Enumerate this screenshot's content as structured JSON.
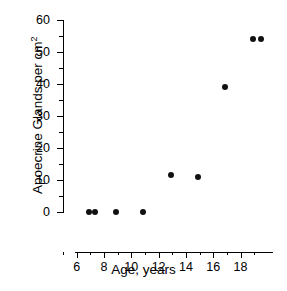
{
  "chart_data": {
    "type": "scatter",
    "title": "",
    "xlabel": "Age,  years",
    "ylabel": "Apoecrine Glands per cm",
    "ylabel_superscript": "2",
    "xlim": [
      5,
      19.5
    ],
    "ylim": [
      0,
      60
    ],
    "grid": false,
    "legend": null,
    "x_ticks": [
      6,
      8,
      10,
      12,
      14,
      16,
      18
    ],
    "x_tick_labels": [
      "6",
      "8",
      "10",
      "12",
      "14",
      "16",
      "18"
    ],
    "x_minor_ticks": [
      5,
      7,
      9,
      11,
      13,
      15,
      17,
      19
    ],
    "y_ticks": [
      0,
      10,
      20,
      30,
      40,
      50,
      60
    ],
    "y_tick_labels": [
      "0",
      "10",
      "20",
      "30",
      "40",
      "50",
      "60"
    ],
    "y_minor_ticks": [
      5,
      15,
      25,
      35,
      45,
      55
    ],
    "series": [
      {
        "name": "Apoecrine gland density",
        "marker": "filled-circle",
        "color": "#111111",
        "points": [
          {
            "x": 6.0,
            "y": 0
          },
          {
            "x": 6.5,
            "y": 0
          },
          {
            "x": 8.0,
            "y": 0
          },
          {
            "x": 10.0,
            "y": 0
          },
          {
            "x": 12.0,
            "y": 11.5
          },
          {
            "x": 14.0,
            "y": 11
          },
          {
            "x": 16.0,
            "y": 39
          },
          {
            "x": 18.0,
            "y": 54
          },
          {
            "x": 18.6,
            "y": 54
          }
        ]
      }
    ]
  }
}
